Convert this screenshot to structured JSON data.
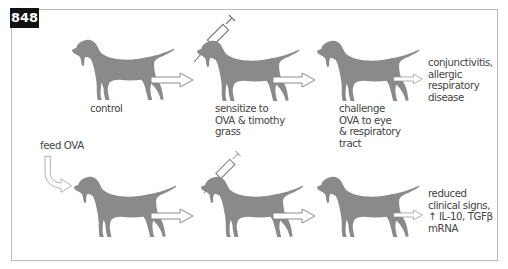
{
  "figure": {
    "number": "848",
    "colors": {
      "dog_fill": "#8a8a8a",
      "frame_border": "#bcbcbc",
      "badge_bg": "#111111",
      "arrow_stroke": "#8a8a8a",
      "text": "#444444"
    }
  },
  "top_row": {
    "steps": [
      {
        "id": "control",
        "label": "control",
        "icon": "dog-icon"
      },
      {
        "id": "sensitize",
        "label_lines": [
          "sensitize to",
          "OVA & timothy",
          "grass"
        ],
        "icon": "dog-with-syringe-icon"
      },
      {
        "id": "challenge",
        "label_lines": [
          "challenge",
          "OVA to eye",
          "& respiratory",
          "tract"
        ],
        "icon": "dog-icon"
      }
    ],
    "outcome_lines": [
      "conjunctivitis,",
      "allergic",
      "respiratory",
      "disease"
    ]
  },
  "bottom_row": {
    "pre_step_label": "feed OVA",
    "steps": [
      {
        "id": "fed",
        "icon": "dog-icon"
      },
      {
        "id": "sensitize",
        "icon": "dog-with-syringe-icon"
      },
      {
        "id": "challenge",
        "icon": "dog-icon"
      }
    ],
    "outcome_lines": [
      "reduced",
      "clinical signs,",
      "↑ IL-10, TGFβ",
      "mRNA"
    ]
  }
}
